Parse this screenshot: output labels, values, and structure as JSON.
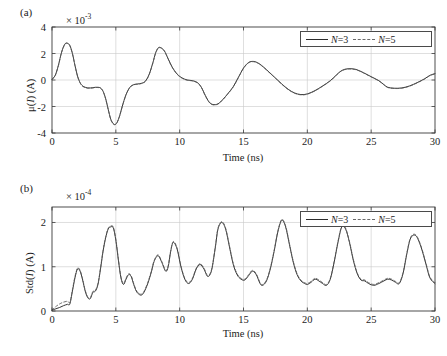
{
  "figure": {
    "caption_tags": [
      "(a)",
      "(b)"
    ],
    "legend": {
      "series": [
        {
          "label": "N=3",
          "style": "solid",
          "color": "#2b2b2b"
        },
        {
          "label": "N=5",
          "style": "dashed",
          "color": "#5a5a5a"
        }
      ]
    }
  },
  "chart_data": [
    {
      "type": "line",
      "panel": "(a)",
      "title": "",
      "xlabel": "Time (ns)",
      "ylabel": "μ(I) (A)",
      "ylabel_parts": {
        "prefix": "μ(",
        "italic": "I",
        "suffix": ") (A)"
      },
      "y_exponent_label": "× 10",
      "y_exponent_power": "-3",
      "y_scale": 0.001,
      "xlim": [
        0,
        30
      ],
      "ylim": [
        -4,
        4
      ],
      "xticks": [
        0,
        5,
        10,
        15,
        20,
        25,
        30
      ],
      "yticks": [
        -4,
        -2,
        0,
        2,
        4
      ],
      "grid": true,
      "series": [
        {
          "name": "N=3",
          "style": "solid",
          "x": [
            0,
            0.25,
            0.5,
            0.75,
            1.0,
            1.2,
            1.4,
            1.6,
            1.8,
            2.0,
            2.2,
            2.4,
            2.6,
            2.8,
            3.0,
            3.2,
            3.4,
            3.6,
            3.8,
            4.0,
            4.2,
            4.4,
            4.6,
            4.8,
            4.95,
            5.1,
            5.3,
            5.5,
            5.8,
            6.1,
            6.4,
            6.7,
            7.0,
            7.3,
            7.6,
            7.9,
            8.1,
            8.3,
            8.5,
            8.8,
            9.1,
            9.4,
            9.8,
            10.2,
            10.6,
            11.0,
            11.4,
            11.7,
            12.0,
            12.3,
            12.6,
            13.0,
            13.4,
            13.8,
            14.2,
            14.6,
            15.0,
            15.4,
            15.8,
            16.2,
            16.6,
            17.0,
            17.5,
            18.0,
            18.5,
            19.0,
            19.5,
            20.0,
            20.6,
            21.2,
            21.8,
            22.3,
            22.7,
            23.2,
            23.8,
            24.4,
            25.0,
            25.6,
            26.0,
            26.3,
            26.8,
            27.4,
            28.0,
            28.6,
            29.2,
            29.6,
            30.0
          ],
          "y": [
            0.05,
            0.35,
            1.1,
            2.1,
            2.7,
            2.78,
            2.6,
            2.0,
            1.1,
            0.3,
            -0.2,
            -0.45,
            -0.55,
            -0.6,
            -0.6,
            -0.58,
            -0.55,
            -0.55,
            -0.6,
            -0.85,
            -1.4,
            -2.2,
            -2.95,
            -3.3,
            -3.35,
            -3.2,
            -2.7,
            -2.0,
            -1.1,
            -0.55,
            -0.35,
            -0.3,
            -0.25,
            -0.1,
            0.4,
            1.3,
            2.0,
            2.4,
            2.45,
            2.2,
            1.6,
            1.0,
            0.45,
            0.15,
            0.0,
            -0.05,
            -0.2,
            -0.55,
            -1.15,
            -1.65,
            -1.85,
            -1.8,
            -1.45,
            -1.0,
            -0.5,
            0.2,
            0.9,
            1.32,
            1.4,
            1.25,
            0.95,
            0.6,
            0.15,
            -0.3,
            -0.7,
            -0.98,
            -1.1,
            -1.05,
            -0.8,
            -0.45,
            -0.05,
            0.4,
            0.72,
            0.85,
            0.8,
            0.55,
            0.25,
            -0.05,
            -0.35,
            -0.55,
            -0.62,
            -0.6,
            -0.45,
            -0.2,
            0.1,
            0.35,
            0.48,
            0.55
          ]
        },
        {
          "name": "N=5",
          "style": "dashed",
          "x": [
            0,
            0.25,
            0.5,
            0.75,
            1.0,
            1.2,
            1.4,
            1.6,
            1.8,
            2.0,
            2.2,
            2.4,
            2.6,
            2.8,
            3.0,
            3.2,
            3.4,
            3.6,
            3.8,
            4.0,
            4.2,
            4.4,
            4.6,
            4.8,
            4.95,
            5.1,
            5.3,
            5.5,
            5.8,
            6.1,
            6.4,
            6.7,
            7.0,
            7.3,
            7.6,
            7.9,
            8.1,
            8.3,
            8.5,
            8.8,
            9.1,
            9.4,
            9.8,
            10.2,
            10.6,
            11.0,
            11.4,
            11.7,
            12.0,
            12.3,
            12.6,
            13.0,
            13.4,
            13.8,
            14.2,
            14.6,
            15.0,
            15.4,
            15.8,
            16.2,
            16.6,
            17.0,
            17.5,
            18.0,
            18.5,
            19.0,
            19.5,
            20.0,
            20.6,
            21.2,
            21.8,
            22.3,
            22.7,
            23.2,
            23.8,
            24.4,
            25.0,
            25.6,
            26.0,
            26.3,
            26.8,
            27.4,
            28.0,
            28.6,
            29.2,
            29.6,
            30.0
          ],
          "y": [
            0.05,
            0.33,
            1.08,
            2.08,
            2.68,
            2.76,
            2.58,
            1.98,
            1.08,
            0.28,
            -0.22,
            -0.47,
            -0.57,
            -0.62,
            -0.62,
            -0.6,
            -0.57,
            -0.57,
            -0.62,
            -0.87,
            -1.42,
            -2.22,
            -2.97,
            -3.32,
            -3.36,
            -3.21,
            -2.71,
            -2.01,
            -1.11,
            -0.57,
            -0.37,
            -0.32,
            -0.27,
            -0.12,
            0.38,
            1.28,
            1.98,
            2.38,
            2.43,
            2.18,
            1.58,
            0.98,
            0.43,
            0.13,
            -0.02,
            -0.07,
            -0.22,
            -0.57,
            -1.17,
            -1.67,
            -1.87,
            -1.82,
            -1.47,
            -1.02,
            -0.52,
            0.18,
            0.88,
            1.3,
            1.38,
            1.23,
            0.93,
            0.58,
            0.13,
            -0.32,
            -0.72,
            -1.0,
            -1.12,
            -1.07,
            -0.82,
            -0.47,
            -0.07,
            0.38,
            0.7,
            0.83,
            0.78,
            0.53,
            0.23,
            -0.07,
            -0.37,
            -0.57,
            -0.64,
            -0.62,
            -0.47,
            -0.22,
            0.08,
            0.33,
            0.46,
            0.53
          ]
        }
      ]
    },
    {
      "type": "line",
      "panel": "(b)",
      "title": "",
      "xlabel": "Time (ns)",
      "ylabel": "Std(I) (A)",
      "ylabel_parts": {
        "prefix": "Std(",
        "italic": "I",
        "suffix": ") (A)"
      },
      "y_exponent_label": "× 10",
      "y_exponent_power": "-4",
      "y_scale": 0.0001,
      "xlim": [
        0,
        30
      ],
      "ylim": [
        0,
        2.35
      ],
      "xticks": [
        0,
        5,
        10,
        15,
        20,
        25,
        30
      ],
      "yticks": [
        0,
        1,
        2
      ],
      "grid": true,
      "series": [
        {
          "name": "N=3",
          "style": "solid",
          "x": [
            0,
            0.3,
            0.6,
            0.9,
            1.2,
            1.4,
            1.6,
            1.8,
            2.0,
            2.2,
            2.4,
            2.6,
            2.8,
            3.0,
            3.2,
            3.4,
            3.6,
            3.8,
            4.0,
            4.2,
            4.4,
            4.6,
            4.8,
            5.0,
            5.2,
            5.4,
            5.6,
            5.8,
            6.0,
            6.2,
            6.4,
            6.6,
            6.8,
            7.0,
            7.2,
            7.5,
            7.8,
            8.0,
            8.3,
            8.6,
            8.9,
            9.1,
            9.3,
            9.5,
            9.8,
            10.1,
            10.4,
            10.7,
            11.0,
            11.3,
            11.6,
            11.9,
            12.2,
            12.5,
            12.8,
            13.0,
            13.3,
            13.6,
            13.9,
            14.2,
            14.5,
            14.8,
            15.1,
            15.4,
            15.7,
            16.0,
            16.3,
            16.5,
            16.8,
            17.1,
            17.4,
            17.7,
            18.0,
            18.3,
            18.6,
            18.9,
            19.2,
            19.5,
            19.8,
            20.0,
            20.3,
            20.6,
            20.9,
            21.2,
            21.5,
            21.8,
            22.1,
            22.4,
            22.7,
            23.0,
            23.3,
            23.6,
            23.9,
            24.2,
            24.5,
            24.8,
            25.2,
            25.6,
            26.0,
            26.3,
            26.6,
            26.9,
            27.2,
            27.5,
            27.8,
            28.1,
            28.5,
            28.9,
            29.3,
            29.6,
            30.0
          ],
          "y": [
            0.02,
            0.05,
            0.08,
            0.12,
            0.15,
            0.16,
            0.45,
            0.75,
            0.95,
            0.9,
            0.7,
            0.45,
            0.3,
            0.28,
            0.42,
            0.45,
            0.6,
            0.95,
            1.35,
            1.65,
            1.85,
            1.9,
            1.88,
            1.6,
            1.15,
            0.75,
            0.6,
            0.72,
            0.82,
            0.78,
            0.6,
            0.45,
            0.38,
            0.36,
            0.42,
            0.62,
            0.9,
            1.12,
            1.25,
            1.1,
            0.9,
            1.0,
            1.35,
            1.55,
            1.4,
            1.0,
            0.72,
            0.62,
            0.72,
            0.95,
            1.05,
            0.95,
            0.78,
            0.92,
            1.45,
            1.85,
            2.0,
            1.85,
            1.45,
            1.05,
            0.82,
            0.72,
            0.7,
            0.8,
            0.9,
            0.82,
            0.62,
            0.58,
            0.68,
            0.95,
            1.35,
            1.8,
            2.05,
            1.9,
            1.5,
            1.1,
            0.82,
            0.68,
            0.62,
            0.6,
            0.65,
            0.72,
            0.68,
            0.62,
            0.58,
            0.72,
            1.1,
            1.55,
            1.9,
            1.85,
            1.55,
            1.15,
            0.85,
            0.7,
            0.68,
            0.62,
            0.58,
            0.62,
            0.68,
            0.72,
            0.7,
            0.65,
            0.62,
            0.85,
            1.3,
            1.65,
            1.7,
            1.45,
            1.05,
            0.75,
            0.62
          ]
        },
        {
          "name": "N=5",
          "style": "dashed",
          "x": [
            0,
            0.3,
            0.6,
            0.9,
            1.2,
            1.4,
            1.6,
            1.8,
            2.0,
            2.2,
            2.4,
            2.6,
            2.8,
            3.0,
            3.2,
            3.4,
            3.6,
            3.8,
            4.0,
            4.2,
            4.4,
            4.6,
            4.8,
            5.0,
            5.2,
            5.4,
            5.6,
            5.8,
            6.0,
            6.2,
            6.4,
            6.6,
            6.8,
            7.0,
            7.2,
            7.5,
            7.8,
            8.0,
            8.3,
            8.6,
            8.9,
            9.1,
            9.3,
            9.5,
            9.8,
            10.1,
            10.4,
            10.7,
            11.0,
            11.3,
            11.6,
            11.9,
            12.2,
            12.5,
            12.8,
            13.0,
            13.3,
            13.6,
            13.9,
            14.2,
            14.5,
            14.8,
            15.1,
            15.4,
            15.7,
            16.0,
            16.3,
            16.5,
            16.8,
            17.1,
            17.4,
            17.7,
            18.0,
            18.3,
            18.6,
            18.9,
            19.2,
            19.5,
            19.8,
            20.0,
            20.3,
            20.6,
            20.9,
            21.2,
            21.5,
            21.8,
            22.1,
            22.4,
            22.7,
            23.0,
            23.3,
            23.6,
            23.9,
            24.2,
            24.5,
            24.8,
            25.2,
            25.6,
            26.0,
            26.3,
            26.6,
            26.9,
            27.2,
            27.5,
            27.8,
            28.1,
            28.5,
            28.9,
            29.3,
            29.6,
            30.0
          ],
          "y": [
            0.02,
            0.1,
            0.16,
            0.2,
            0.22,
            0.2,
            0.48,
            0.78,
            0.97,
            0.92,
            0.72,
            0.47,
            0.32,
            0.3,
            0.44,
            0.47,
            0.62,
            0.97,
            1.37,
            1.67,
            1.87,
            1.92,
            1.9,
            1.62,
            1.17,
            0.77,
            0.62,
            0.74,
            0.84,
            0.8,
            0.62,
            0.47,
            0.4,
            0.38,
            0.44,
            0.64,
            0.92,
            1.14,
            1.27,
            1.12,
            0.92,
            1.02,
            1.37,
            1.57,
            1.42,
            1.02,
            0.74,
            0.64,
            0.74,
            0.97,
            1.07,
            0.97,
            0.8,
            0.94,
            1.47,
            1.87,
            2.02,
            1.87,
            1.47,
            1.07,
            0.84,
            0.74,
            0.72,
            0.82,
            0.92,
            0.84,
            0.64,
            0.6,
            0.7,
            0.97,
            1.37,
            1.82,
            2.07,
            1.92,
            1.52,
            1.12,
            0.84,
            0.7,
            0.64,
            0.62,
            0.67,
            0.74,
            0.7,
            0.64,
            0.6,
            0.74,
            1.12,
            1.57,
            1.92,
            1.87,
            1.57,
            1.17,
            0.87,
            0.72,
            0.7,
            0.64,
            0.6,
            0.64,
            0.7,
            0.74,
            0.72,
            0.67,
            0.64,
            0.87,
            1.32,
            1.67,
            1.72,
            1.47,
            1.07,
            0.77,
            0.64
          ]
        }
      ]
    }
  ]
}
